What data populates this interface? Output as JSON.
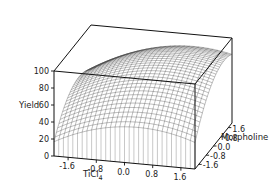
{
  "chart_data": {
    "type": "surface3d",
    "title": "",
    "xlabel": "TiCl4",
    "ylabel": "Morpholine",
    "zlabel": "Yield",
    "x_ticks": [
      "-1.6",
      "-0.8",
      "0.0",
      "0.8",
      "1.6"
    ],
    "y_ticks": [
      "-1.6",
      "-0.8",
      "0.0",
      "0.8",
      "1.6"
    ],
    "z_ticks": [
      "0",
      "20",
      "40",
      "60",
      "80",
      "100"
    ],
    "xlim": [
      -2,
      2
    ],
    "ylim": [
      -2,
      2
    ],
    "zlim": [
      0,
      100
    ],
    "grid": "wireframe mesh",
    "surface_samples": {
      "x": [
        -2,
        -1,
        0,
        1,
        2
      ],
      "y": [
        -2,
        -1,
        0,
        1,
        2
      ],
      "z": [
        [
          15,
          30,
          40,
          42,
          38
        ],
        [
          32,
          50,
          62,
          66,
          62
        ],
        [
          45,
          65,
          78,
          84,
          82
        ],
        [
          48,
          70,
          84,
          90,
          88
        ],
        [
          42,
          66,
          80,
          86,
          84
        ]
      ]
    }
  },
  "labels": {
    "zlabel": "Yield",
    "xlabel_main": "TiCl",
    "xlabel_sub": "4",
    "ylabel": "Morpholine"
  }
}
